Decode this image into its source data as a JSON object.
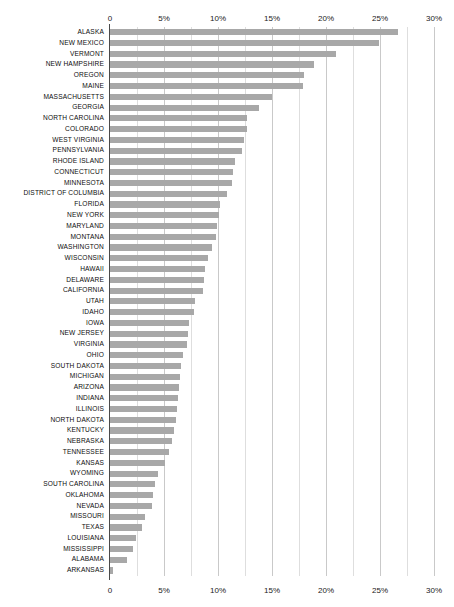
{
  "chart_data": {
    "type": "bar",
    "orientation": "horizontal",
    "title": "",
    "subtitle": "",
    "xlabel": "",
    "ylabel": "",
    "xlim": [
      0,
      30
    ],
    "xunit": "%",
    "grid": true,
    "legend": null,
    "bar_color": "#a8a8a8",
    "axis_color": "#4a4a4a",
    "gridline_color": "#c9c9c9",
    "minor_gridline_color": "#dedede",
    "x_tick_labels": [
      "0",
      "5%",
      "10%",
      "15%",
      "20%",
      "25%",
      "30%"
    ],
    "x_tick_values": [
      0,
      5,
      10,
      15,
      20,
      25,
      30
    ],
    "x_minor_tick_values": [
      2.5,
      7.5,
      12.5,
      17.5,
      22.5,
      27.5
    ],
    "categories": [
      "ALASKA",
      "NEW MEXICO",
      "VERMONT",
      "NEW HAMPSHIRE",
      "OREGON",
      "MAINE",
      "MASSACHUSETTS",
      "GEORGIA",
      "NORTH CAROLINA",
      "COLORADO",
      "WEST VIRGINIA",
      "PENNSYLVANIA",
      "RHODE ISLAND",
      "CONNECTICUT",
      "MINNESOTA",
      "DISTRICT OF COLUMBIA",
      "FLORIDA",
      "NEW YORK",
      "MARYLAND",
      "MONTANA",
      "WASHINGTON",
      "WISCONSIN",
      "HAWAII",
      "DELAWARE",
      "CALIFORNIA",
      "UTAH",
      "IDAHO",
      "IOWA",
      "NEW JERSEY",
      "VIRGINIA",
      "OHIO",
      "SOUTH DAKOTA",
      "MICHIGAN",
      "ARIZONA",
      "INDIANA",
      "ILLINOIS",
      "NORTH DAKOTA",
      "KENTUCKY",
      "NEBRASKA",
      "TENNESSEE",
      "KANSAS",
      "WYOMING",
      "SOUTH CAROLINA",
      "OKLAHOMA",
      "NEVADA",
      "MISSOURI",
      "TEXAS",
      "LOUISIANA",
      "MISSISSIPPI",
      "ALABAMA",
      "ARKANSAS"
    ],
    "values": [
      26.7,
      24.9,
      20.9,
      18.9,
      18.0,
      17.9,
      15.0,
      13.8,
      12.7,
      12.7,
      12.4,
      12.2,
      11.6,
      11.4,
      11.3,
      10.8,
      10.2,
      10.1,
      9.9,
      9.8,
      9.4,
      9.1,
      8.8,
      8.7,
      8.6,
      7.9,
      7.8,
      7.3,
      7.2,
      7.1,
      6.8,
      6.6,
      6.5,
      6.4,
      6.3,
      6.2,
      6.1,
      5.9,
      5.7,
      5.5,
      5.1,
      4.4,
      4.2,
      4.0,
      3.9,
      3.2,
      3.0,
      2.4,
      2.1,
      1.6,
      0.3
    ]
  }
}
